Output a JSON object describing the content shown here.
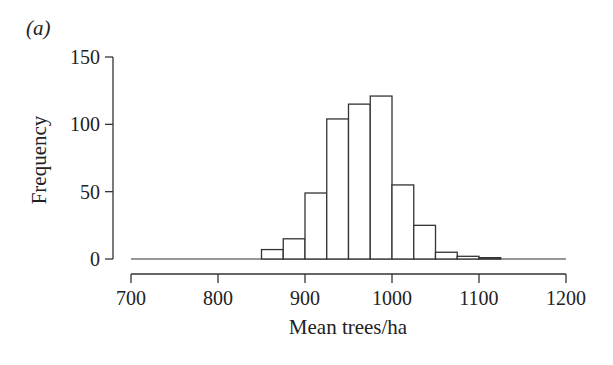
{
  "panel_label": "(a)",
  "chart_data": {
    "type": "bar",
    "title": "",
    "panel_label": "(a)",
    "xlabel": "Mean trees/ha",
    "ylabel": "Frequency",
    "xlim": [
      700,
      1200
    ],
    "ylim": [
      0,
      150
    ],
    "xticks": [
      700,
      800,
      900,
      1000,
      1100,
      1200
    ],
    "yticks": [
      0,
      50,
      100,
      150
    ],
    "bin_width": 25,
    "bin_edges": [
      850,
      875,
      900,
      925,
      950,
      975,
      1000,
      1025,
      1050,
      1075,
      1100,
      1125
    ],
    "categories": [
      "850-875",
      "875-900",
      "900-925",
      "925-950",
      "950-975",
      "975-1000",
      "1000-1025",
      "1025-1050",
      "1050-1075",
      "1075-1100",
      "1100-1125"
    ],
    "values": [
      7,
      15,
      49,
      104,
      115,
      121,
      55,
      25,
      5,
      2,
      1
    ],
    "grid": false,
    "legend": null,
    "bar_fill": "#ffffff",
    "bar_stroke": "#333333"
  }
}
